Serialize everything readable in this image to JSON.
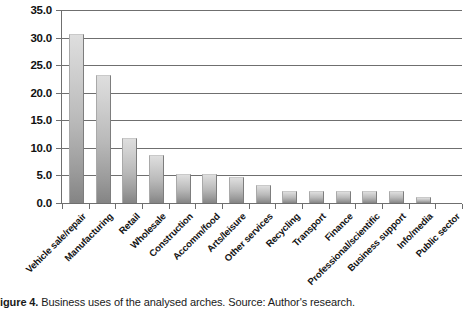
{
  "caption": {
    "figure_label": "igure 4.",
    "text": "Business uses of the analysed arches. Source: Author's research."
  },
  "chart_data": {
    "type": "bar",
    "title": "",
    "xlabel": "",
    "ylabel": "",
    "ylim": [
      0,
      35
    ],
    "ytick_step": 5,
    "grid": true,
    "legend": "none",
    "orientation": "vertical",
    "bar_color_top": "#dedede",
    "bar_color_bottom": "#848484",
    "axis_color": "#6f6f6f",
    "yticks": [
      "0.0",
      "5.0",
      "10.0",
      "15.0",
      "20.0",
      "25.0",
      "30.0",
      "35.0"
    ],
    "ytick_values": [
      0,
      5,
      10,
      15,
      20,
      25,
      30,
      35
    ],
    "categories": [
      "Vehicle sale/repair",
      "Manufacturing",
      "Retail",
      "Wholesale",
      "Construction",
      "Accomm/food",
      "Arts/leisure",
      "Other services",
      "Recycling",
      "Transport",
      "Finance",
      "Professional/scientific",
      "Business support",
      "Info/media",
      "Public sector"
    ],
    "values": [
      30.5,
      23.0,
      11.6,
      8.5,
      5.0,
      5.0,
      4.5,
      3.0,
      2.0,
      2.0,
      2.0,
      2.0,
      2.0,
      1.0,
      0.0
    ]
  }
}
